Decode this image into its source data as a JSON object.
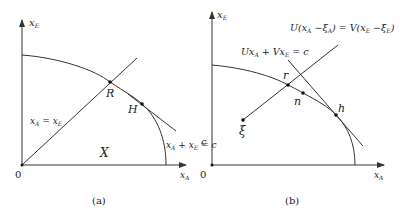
{
  "panel_a": {
    "caption": "(a)",
    "y_axis_label": "x",
    "y_axis_sub": "E",
    "x_axis_label": "x",
    "x_axis_sub": "A",
    "origin_label": "0",
    "point_R": "R",
    "point_H": "H",
    "region_label": "X",
    "diag_eq": {
      "l1": "x",
      "s1": "A",
      "eq": " = ",
      "l2": "x",
      "s2": "E"
    },
    "budget_eq": {
      "l1": "x",
      "s1": "A",
      "plus": " + ",
      "l2": "x",
      "s2": "E",
      "eq": " = c"
    }
  },
  "panel_b": {
    "caption": "(b)",
    "y_axis_label": "x",
    "y_axis_sub": "E",
    "x_axis_label": "x",
    "x_axis_sub": "A",
    "origin_label": "0",
    "c_label": "c",
    "point_r": "r",
    "point_n": "n",
    "point_h": "h",
    "point_xi": "ξ",
    "line_eq": {
      "text": "Ux",
      "s1": "A",
      "mid": " + Vx",
      "s2": "E",
      "end": " = c"
    },
    "ray_eq": {
      "t1": "U(x",
      "s1": "A",
      "t2": " −ξ",
      "s2": "A",
      "t3": ") = V(x",
      "s3": "E",
      "t4": " −ξ",
      "s4": "E",
      "t5": ")"
    }
  },
  "colors": {
    "line": "#333333",
    "text": "#222222",
    "point": "#111111"
  }
}
